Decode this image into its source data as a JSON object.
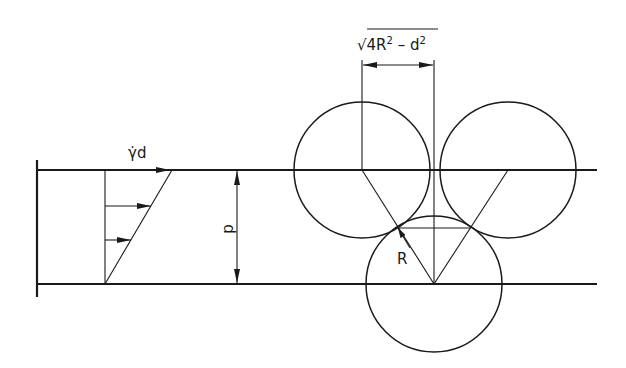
{
  "diagram": {
    "labels": {
      "shear_rate_label": "γ̇d",
      "gap_label": "d",
      "radius_label": "R",
      "formula": {
        "sqrt": "√",
        "term1": "4R",
        "sup1": "2",
        "minus": " – ",
        "term2": "d",
        "sup2": "2"
      }
    },
    "colors": {
      "stroke": "#1a1a1a",
      "background": "#ffffff"
    },
    "geometry": {
      "plate_top_y": 170,
      "plate_bottom_y": 284,
      "circle_radius": 68,
      "circles": [
        {
          "name": "left-upper-sphere",
          "cx": 362,
          "cy": 170
        },
        {
          "name": "right-upper-sphere",
          "cx": 508,
          "cy": 170
        },
        {
          "name": "lower-sphere",
          "cx": 434,
          "cy": 284
        }
      ]
    }
  }
}
